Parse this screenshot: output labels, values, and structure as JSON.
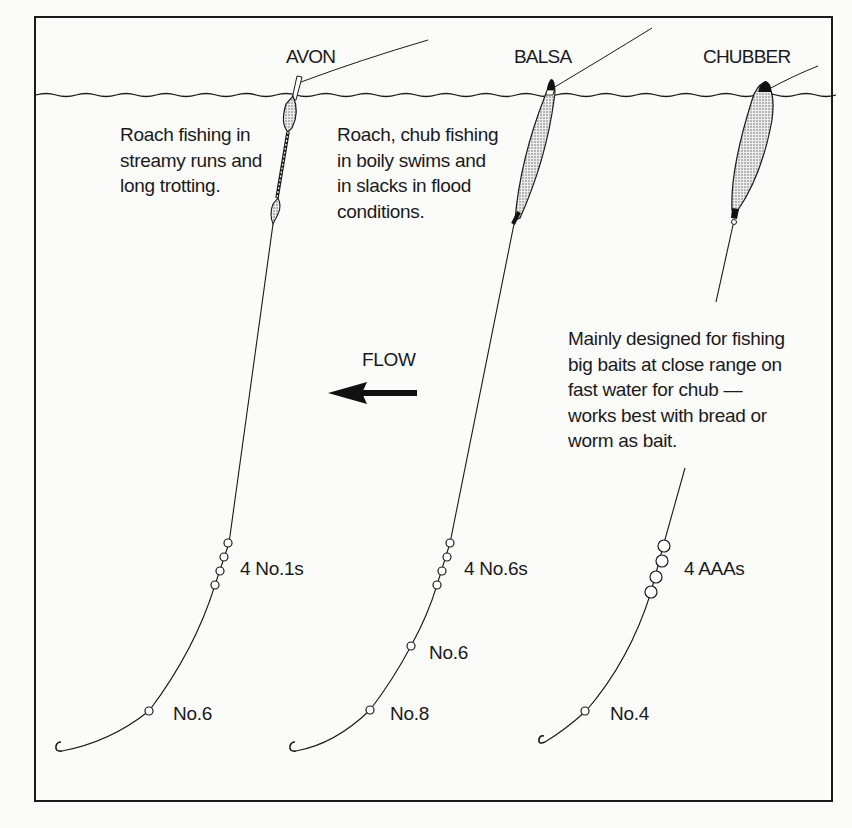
{
  "diagram": {
    "floats": [
      {
        "name": "AVON",
        "description": [
          "Roach fishing in",
          "streamy runs and",
          "long trotting."
        ],
        "shot_label": "4 No.1s",
        "dropper_labels": [
          "No.6"
        ]
      },
      {
        "name": "BALSA",
        "description": [
          "Roach, chub fishing",
          "in  boily swims and",
          "in slacks in flood",
          "conditions."
        ],
        "shot_label": "4 No.6s",
        "dropper_labels": [
          "No.6",
          "No.8"
        ]
      },
      {
        "name": "CHUBBER",
        "description": [
          "Mainly designed for fishing",
          "big baits at close range on",
          "fast water for chub —",
          "works best with bread or",
          "worm as bait."
        ],
        "shot_label": "4 AAAs",
        "dropper_labels": [
          "No.4"
        ]
      }
    ],
    "flow": {
      "label": "FLOW",
      "direction": "left",
      "icon": "left-arrow-icon"
    },
    "colors": {
      "ink": "#1a1a1a",
      "background": "#fbfbfa",
      "float_fill": "#d9d9d9"
    }
  }
}
